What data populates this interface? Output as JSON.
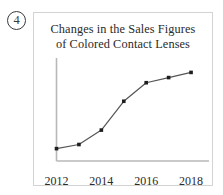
{
  "item": {
    "number_label": "4",
    "marker_style": "circled-number"
  },
  "chart_data": {
    "type": "line",
    "title": "Changes in the Sales Figures of Colored Contact Lenses",
    "title_lines": [
      "Changes in the Sales Figures",
      "of Colored Contact Lenses"
    ],
    "xlabel": "",
    "ylabel": "",
    "x": [
      2012,
      2013,
      2014,
      2015,
      2016,
      2017,
      2018
    ],
    "categories": [
      "2012",
      "2013",
      "2014",
      "2015",
      "2016",
      "2017",
      "2018"
    ],
    "values": [
      12,
      16,
      30,
      58,
      76,
      81,
      86
    ],
    "series": [
      {
        "name": "Sales figures of colored contact lenses",
        "values": [
          12,
          16,
          30,
          58,
          76,
          81,
          86
        ]
      }
    ],
    "tick_labels": [
      "2012",
      "2014",
      "2016",
      "2018"
    ],
    "tick_values": [
      2012,
      2014,
      2016,
      2018
    ],
    "xlim": [
      2012,
      2018.8
    ],
    "ylim": [
      0,
      100
    ],
    "grid": false,
    "legend": "none",
    "y_axis_labeled": false,
    "marker": "square-dot",
    "line_color": "#555555",
    "marker_color": "#1e1e1e",
    "axis_color": "#b8b8b8",
    "frame_color": "#d3d3d3",
    "text_color": "#2a2a2a"
  }
}
